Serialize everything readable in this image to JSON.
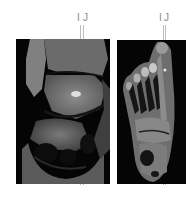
{
  "figure": {
    "panels": [
      {
        "id": "left",
        "view": "coronal-ankle-mri",
        "markers": [
          {
            "label": "I"
          },
          {
            "label": "J"
          }
        ]
      },
      {
        "id": "right",
        "view": "axial-foot-mri",
        "markers": [
          {
            "label": "I"
          },
          {
            "label": "J"
          }
        ]
      }
    ],
    "colors": {
      "background": "#ffffff",
      "panel": "#050505",
      "marker_line": "#bdbdbd",
      "label": "#8a8a8a"
    }
  }
}
